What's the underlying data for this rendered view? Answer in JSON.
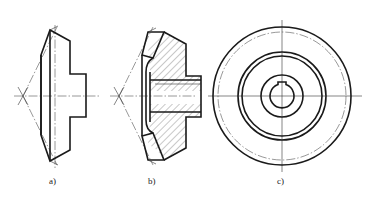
{
  "figure": {
    "views": [
      {
        "id": "a",
        "label": "a)",
        "description": "bevel gear external view"
      },
      {
        "id": "b",
        "label": "b)",
        "description": "bevel gear half-section view"
      },
      {
        "id": "c",
        "label": "c)",
        "description": "bevel gear end view with keyway"
      }
    ]
  }
}
